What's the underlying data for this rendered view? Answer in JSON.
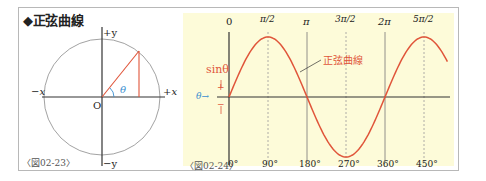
{
  "title": "◆正弦曲線",
  "figure1": {
    "caption": "〈図02-23〉",
    "labels": {
      "plus_y": "+y",
      "minus_y": "−y",
      "plus_x": "+x",
      "minus_x": "−x",
      "origin": "O",
      "theta": "θ"
    }
  },
  "figure2": {
    "caption": "〈図02-24〉",
    "curve_label": "正弦曲線",
    "y_label": "sinθ",
    "plus_sign": "+",
    "minus_sign": "−",
    "theta_arrow": "θ→",
    "top_ticks": [
      "0",
      "π/2",
      "π",
      "3π/2",
      "2π",
      "5π/2"
    ],
    "bottom_ticks": [
      "0°",
      "90°",
      "180°",
      "270°",
      "360°",
      "450°"
    ]
  },
  "colors": {
    "curve": "#e0553a",
    "theta": "#3b8fd0",
    "axis": "#333333",
    "panel": "#fdfbd9",
    "circle": "#888888"
  },
  "chart_data": {
    "type": "line",
    "title": "正弦曲線",
    "xlabel": "θ",
    "ylabel": "sinθ",
    "x": [
      0,
      90,
      180,
      270,
      360,
      450,
      505
    ],
    "series": [
      {
        "name": "sinθ",
        "values": [
          0,
          1,
          0,
          -1,
          0,
          1,
          0.57
        ]
      }
    ],
    "x_ticks_top": [
      "0",
      "π/2",
      "π",
      "3π/2",
      "2π",
      "5π/2"
    ],
    "x_ticks_bottom": [
      "0°",
      "90°",
      "180°",
      "270°",
      "360°",
      "450°"
    ],
    "ylim": [
      -1,
      1
    ],
    "xlim": [
      0,
      505
    ]
  }
}
